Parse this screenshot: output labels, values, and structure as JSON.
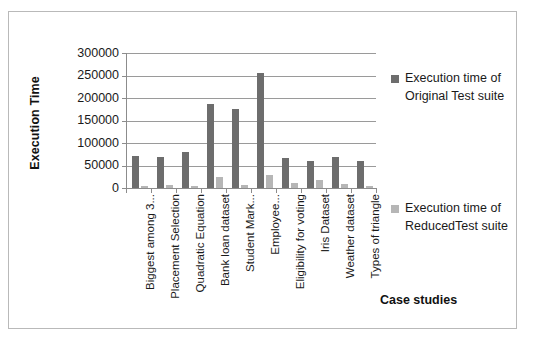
{
  "chart_data": {
    "type": "bar",
    "title": "",
    "xlabel": "Case studies",
    "ylabel": "Execution Time",
    "ylim": [
      0,
      300000
    ],
    "ytick_values": [
      300000,
      250000,
      200000,
      150000,
      100000,
      50000,
      0
    ],
    "ytick_labels": [
      "300000",
      "250000",
      "200000",
      "150000",
      "100000",
      "50000",
      "0"
    ],
    "grid": true,
    "legend_position": "right",
    "categories": [
      "Biggest among 3...",
      "Placement Selection",
      "Quadratic Equation",
      "Bank loan dataset",
      "Student Mark...",
      "Employee...",
      "Eligibility for voting",
      "Iris Dataset",
      "Weather dataset",
      "Types of triangle"
    ],
    "series": [
      {
        "name": "Execution time of Original Test suite",
        "color": "#6d6d6d",
        "values": [
          72000,
          69000,
          79000,
          186000,
          175000,
          255000,
          67000,
          61000,
          69000,
          61000
        ]
      },
      {
        "name": "Execution time of ReducedTest suite",
        "color": "#b6b6b6",
        "values": [
          5000,
          7000,
          5000,
          24000,
          6000,
          28000,
          11000,
          17000,
          8000,
          5000
        ]
      }
    ]
  },
  "legend": {
    "entries": [
      {
        "label": "Execution time of Original Test suite",
        "swatch": "legend-swatch-original"
      },
      {
        "label": "Execution time of ReducedTest suite",
        "swatch": "legend-swatch-reduced"
      }
    ]
  },
  "axes": {
    "y_title": "Execution Time",
    "x_title": "Case studies"
  }
}
